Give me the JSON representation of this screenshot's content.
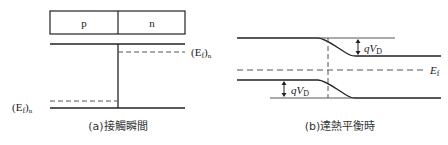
{
  "panel_a": {
    "box": {
      "left_label": "p",
      "right_label": "n"
    },
    "fermi_n_label": "(E",
    "fermi_n_sub": "f",
    "fermi_n_tail": ")",
    "fermi_n_subscript2": "n",
    "fermi_p_label": "(E",
    "fermi_p_sub": "f",
    "fermi_p_tail": ")",
    "fermi_p_subscript2": "n",
    "caption": "(a)接觸瞬間"
  },
  "panel_b": {
    "qvd_upper": "qV",
    "qvd_upper_sub": "D",
    "qvd_lower": "qV",
    "qvd_lower_sub": "D",
    "fermi_label": "E",
    "fermi_sub": "f",
    "caption": "(b)達熱平衡時"
  }
}
